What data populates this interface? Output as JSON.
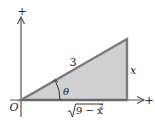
{
  "diagram": {
    "axes": {
      "x_plus": "+",
      "y_plus": "+",
      "origin": "O"
    },
    "triangle": {
      "hypotenuse_label": "3",
      "opposite_label": "x",
      "adjacent_label": "√9 − x²",
      "adjacent_radicand": "9 − x",
      "adjacent_exponent": "2",
      "angle_label": "θ"
    },
    "colors": {
      "fill": "#d0d0d0",
      "edge": "#7a7a7a",
      "axis": "#555555"
    }
  }
}
